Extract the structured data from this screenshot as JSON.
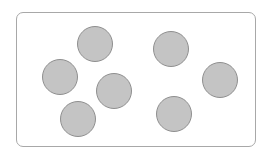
{
  "diagram": {
    "frame": {
      "x": 16,
      "y": 12,
      "width": 240,
      "height": 135,
      "border_color": "#a8a8a8",
      "corner_radius": 7
    },
    "circle_style": {
      "fill": "#c4c4c4",
      "stroke": "#8f8f8f",
      "radius": 18
    },
    "circles": [
      {
        "cx": 95,
        "cy": 44
      },
      {
        "cx": 60,
        "cy": 77
      },
      {
        "cx": 78,
        "cy": 119
      },
      {
        "cx": 114,
        "cy": 91
      },
      {
        "cx": 171,
        "cy": 49
      },
      {
        "cx": 220,
        "cy": 80
      },
      {
        "cx": 174,
        "cy": 114
      }
    ],
    "count": 7
  }
}
